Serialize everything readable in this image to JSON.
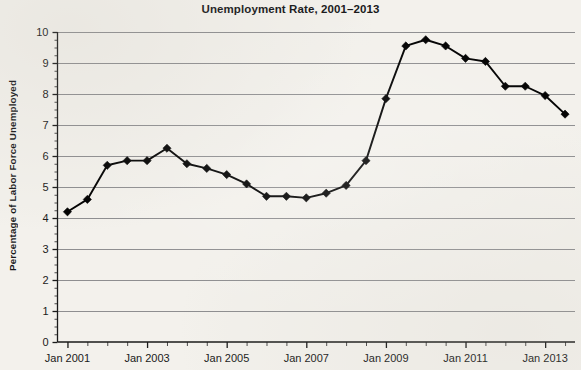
{
  "chart_data": {
    "type": "line",
    "title": "Unemployment Rate, 2001–2013",
    "xlabel": "",
    "ylabel": "Percentage of Labor Force Unemployed",
    "ylim": [
      0,
      10
    ],
    "ytick_labels": [
      "0",
      "1",
      "2",
      "3",
      "4",
      "5",
      "6",
      "7",
      "8",
      "9",
      "10"
    ],
    "ytick_values": [
      0,
      1,
      2,
      3,
      4,
      5,
      6,
      7,
      8,
      9,
      10
    ],
    "xtick_labels": [
      "Jan 2001",
      "Jan 2003",
      "Jan 2005",
      "Jan 2007",
      "Jan 2009",
      "Jan 2011",
      "Jan 2013"
    ],
    "xtick_values": [
      2001.0,
      2003.0,
      2005.0,
      2007.0,
      2009.0,
      2011.0,
      2013.0
    ],
    "xlim": [
      2000.75,
      2013.75
    ],
    "minor_tick_interval_years": 0.5,
    "grid": "horizontal",
    "legend": "none",
    "marker": "diamond",
    "line_color": "#000000",
    "grid_color": "#8e8e90",
    "background_color": "#f3f1ec",
    "series": [
      {
        "name": "Unemployment Rate",
        "x": [
          2001.0,
          2001.5,
          2002.0,
          2002.5,
          2003.0,
          2003.5,
          2004.0,
          2004.5,
          2005.0,
          2005.5,
          2006.0,
          2006.5,
          2007.0,
          2007.5,
          2008.0,
          2008.5,
          2009.0,
          2009.5,
          2010.0,
          2010.5,
          2011.0,
          2011.5,
          2012.0,
          2012.5,
          2013.0,
          2013.5
        ],
        "values": [
          4.2,
          4.6,
          5.7,
          5.85,
          5.85,
          6.25,
          5.75,
          5.6,
          5.4,
          5.1,
          4.7,
          4.7,
          4.65,
          4.8,
          5.05,
          5.85,
          7.85,
          9.55,
          9.75,
          9.55,
          9.15,
          9.05,
          8.25,
          8.25,
          7.95,
          7.35
        ]
      }
    ]
  }
}
